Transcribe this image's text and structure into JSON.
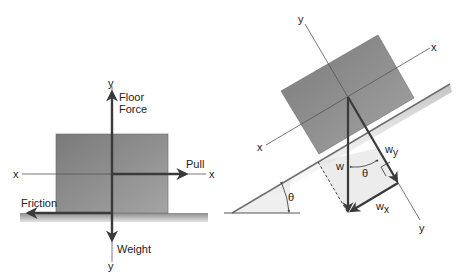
{
  "figure": {
    "left_diagram": {
      "title": "Block on level floor",
      "labels": {
        "y_top": "y",
        "y_bottom": "y",
        "x_left": "x",
        "x_right": "x",
        "floor_force": [
          "Floor",
          "Force"
        ],
        "pull": "Pull",
        "friction": "Friction",
        "weight": "Weight"
      }
    },
    "right_diagram": {
      "title": "Block on inclined plane",
      "labels": {
        "y_top": "y",
        "y_bottom": "y",
        "x_left": "x",
        "x_right": "x",
        "w": "w",
        "wy_base": "w",
        "wy_sub": "y",
        "wx_base": "w",
        "wx_sub": "x",
        "theta_vectors": "θ",
        "theta_incline": "θ"
      }
    },
    "colors": {
      "block": "#8a8a8a",
      "block_light": "#a8a8a8",
      "floor": "#9a9a9a",
      "arrow": "#3a3a3a",
      "axis": "#555555",
      "triangle_fill": "#ececec"
    }
  }
}
